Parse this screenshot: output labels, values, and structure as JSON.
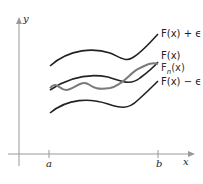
{
  "figure": {
    "axes": {
      "y_label": "y",
      "x_label": "x",
      "tick_a": "a",
      "tick_b": "b"
    },
    "curves": [
      {
        "name": "F(x) + ε",
        "label": "F(x) + ϵ",
        "color": "#222222"
      },
      {
        "name": "F(x)",
        "label": "F(x)",
        "color": "#222222"
      },
      {
        "name": "F_n(x)",
        "label": "F",
        "sub": "n",
        "label_suffix": "(x)",
        "color": "#7a7a7a"
      },
      {
        "name": "F(x) − ε",
        "label": "F(x) − ϵ",
        "color": "#222222"
      }
    ]
  }
}
